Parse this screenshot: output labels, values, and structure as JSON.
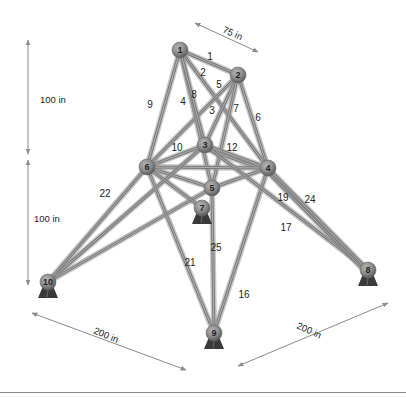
{
  "diagram": {
    "colors": {
      "bar": "#7a7a7a",
      "node": "#8c8c8c",
      "support": "#3a3a3a",
      "dimension": "#8a8a8a",
      "background": "#ffffff"
    },
    "nodes": [
      {
        "id": "1",
        "x": 180,
        "y": 50
      },
      {
        "id": "2",
        "x": 238,
        "y": 75
      },
      {
        "id": "3",
        "x": 205,
        "y": 145
      },
      {
        "id": "4",
        "x": 268,
        "y": 168
      },
      {
        "id": "5",
        "x": 212,
        "y": 188
      },
      {
        "id": "6",
        "x": 147,
        "y": 167
      },
      {
        "id": "7",
        "x": 202,
        "y": 208,
        "support": true
      },
      {
        "id": "8",
        "x": 368,
        "y": 270,
        "support": true
      },
      {
        "id": "9",
        "x": 214,
        "y": 333,
        "support": true
      },
      {
        "id": "10",
        "x": 48,
        "y": 282,
        "support": true
      }
    ],
    "members": [
      {
        "id": "1",
        "from": "1",
        "to": "2",
        "lx": 210,
        "ly": 60
      },
      {
        "id": "2",
        "from": "1",
        "to": "4",
        "lx": 203,
        "ly": 76
      },
      {
        "id": "3",
        "from": "2",
        "to": "6",
        "lx": 212,
        "ly": 114
      },
      {
        "id": "4",
        "from": "1",
        "to": "5",
        "lx": 183,
        "ly": 105
      },
      {
        "id": "5",
        "from": "2",
        "to": "3",
        "lx": 219,
        "ly": 88
      },
      {
        "id": "6",
        "from": "2",
        "to": "4",
        "lx": 258,
        "ly": 121
      },
      {
        "id": "7",
        "from": "2",
        "to": "5",
        "lx": 236,
        "ly": 112
      },
      {
        "id": "8",
        "from": "1",
        "to": "3",
        "lx": 194,
        "ly": 98
      },
      {
        "id": "9",
        "from": "1",
        "to": "6",
        "lx": 150,
        "ly": 108
      },
      {
        "id": "10",
        "from": "3",
        "to": "6",
        "lx": 177,
        "ly": 151
      },
      {
        "id": "11",
        "from": "3",
        "to": "4",
        "lx": 0,
        "ly": 0,
        "hidden_label": true
      },
      {
        "id": "12",
        "from": "3",
        "to": "4",
        "lx": 232,
        "ly": 151
      },
      {
        "id": "13",
        "from": "6",
        "to": "5",
        "lx": 0,
        "ly": 0,
        "hidden_label": true
      },
      {
        "id": "14",
        "from": "5",
        "to": "4",
        "lx": 0,
        "ly": 0,
        "hidden_label": true
      },
      {
        "id": "15",
        "from": "6",
        "to": "4",
        "lx": 0,
        "ly": 0,
        "hidden_label": true
      },
      {
        "id": "16",
        "from": "4",
        "to": "9",
        "lx": 244,
        "ly": 298
      },
      {
        "id": "17",
        "from": "3",
        "to": "8",
        "lx": 286,
        "ly": 231
      },
      {
        "id": "18",
        "from": "5",
        "to": "10",
        "lx": 0,
        "ly": 0,
        "hidden_label": true
      },
      {
        "id": "19",
        "from": "4",
        "to": "8",
        "lx": 283,
        "ly": 201
      },
      {
        "id": "20",
        "from": "3",
        "to": "10",
        "lx": 0,
        "ly": 0,
        "hidden_label": true
      },
      {
        "id": "21",
        "from": "6",
        "to": "9",
        "lx": 190,
        "ly": 266
      },
      {
        "id": "22",
        "from": "6",
        "to": "10",
        "lx": 105,
        "ly": 197
      },
      {
        "id": "23",
        "from": "6",
        "to": "7",
        "lx": 0,
        "ly": 0,
        "hidden_label": true
      },
      {
        "id": "24",
        "from": "4",
        "to": "8",
        "lx": 310,
        "ly": 203
      },
      {
        "id": "25",
        "from": "5",
        "to": "9",
        "lx": 216,
        "ly": 251
      }
    ],
    "dimensions": [
      {
        "label": "75 in",
        "x1": 195,
        "y1": 23,
        "x2": 258,
        "y2": 52,
        "lx": 222,
        "ly": 32,
        "rot": 24
      },
      {
        "label": "100 in",
        "x1": 28,
        "y1": 40,
        "x2": 28,
        "y2": 154,
        "lx": 40,
        "ly": 103,
        "rot": 0
      },
      {
        "label": "100 in",
        "x1": 28,
        "y1": 160,
        "x2": 28,
        "y2": 285,
        "lx": 34,
        "ly": 222,
        "rot": 0
      },
      {
        "label": "200 in",
        "x1": 32,
        "y1": 313,
        "x2": 186,
        "y2": 370,
        "lx": 93,
        "ly": 333,
        "rot": 23
      },
      {
        "label": "200 in",
        "x1": 238,
        "y1": 366,
        "x2": 388,
        "y2": 303,
        "lx": 296,
        "ly": 328,
        "rot": 24
      }
    ]
  }
}
